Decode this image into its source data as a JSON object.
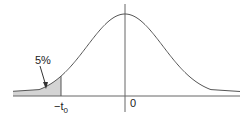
{
  "diagram": {
    "type": "t-distribution-left-tail",
    "tail_label": "5%",
    "critical_label_main": "−t",
    "critical_label_sub": "0",
    "origin_label": "0",
    "tail_fraction": 0.05,
    "colors": {
      "curve": "#555555",
      "axis": "#666666",
      "shade": "#d4d4d4",
      "text": "#222222"
    }
  }
}
